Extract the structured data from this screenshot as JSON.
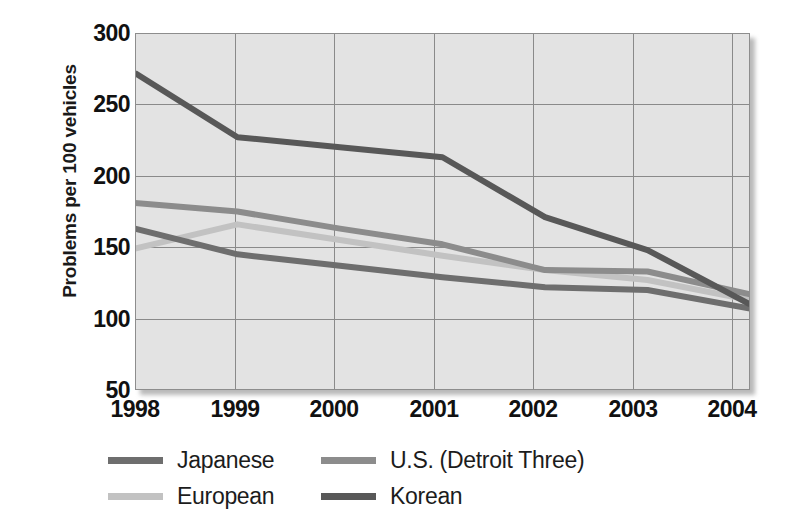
{
  "chart_data": {
    "type": "line",
    "title": "",
    "xlabel": "",
    "ylabel": "Problems per 100 vehicles",
    "x": [
      1998,
      1999,
      2000,
      2001,
      2002,
      2003,
      2004
    ],
    "xtick_labels": [
      "1998",
      "1999",
      "2000",
      "2001",
      "2002",
      "2003",
      "2004"
    ],
    "ytick_labels": [
      "300",
      "250",
      "200",
      "150",
      "100",
      "50"
    ],
    "yticks": [
      300,
      250,
      200,
      150,
      100,
      50
    ],
    "ylim": [
      50,
      300
    ],
    "xlim": [
      1998,
      2004
    ],
    "grid": true,
    "legend_position": "bottom-left",
    "series": [
      {
        "name": "Japanese",
        "color": "#6e6e6e",
        "values": [
          163,
          145,
          137,
          129,
          122,
          120,
          107
        ]
      },
      {
        "name": "U.S. (Detroit Three)",
        "color": "#8c8c8c",
        "values": [
          181,
          175,
          163,
          152,
          134,
          133,
          117
        ]
      },
      {
        "name": "European",
        "color": "#c2c2c2",
        "values": [
          149,
          166,
          155,
          144,
          134,
          127,
          113
        ]
      },
      {
        "name": "Korean",
        "color": "#585858",
        "values": [
          272,
          227,
          220,
          213,
          171,
          148,
          110
        ]
      }
    ]
  },
  "legend": {
    "entries": [
      {
        "label": "Japanese",
        "color": "#6e6e6e"
      },
      {
        "label": "U.S. (Detroit Three)",
        "color": "#8c8c8c"
      },
      {
        "label": "European",
        "color": "#c2c2c2"
      },
      {
        "label": "Korean",
        "color": "#585858"
      }
    ]
  }
}
